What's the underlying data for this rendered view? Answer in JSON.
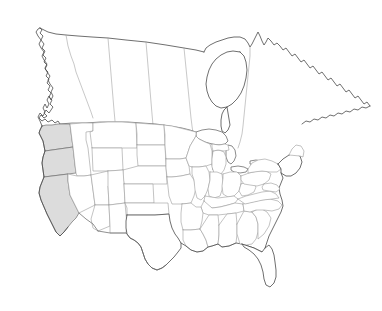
{
  "map": {
    "title": "North America outline map",
    "projection_note": "Continental United States and Canada, blank outline",
    "background_color": "#ffffff",
    "coastline_color": "#4a4a4a",
    "state_border_color": "#9a9a9a",
    "province_border_color": "#a3a3a3",
    "international_border_color": "#6b6b6b",
    "highlight_fill_color": "#dcdcdc",
    "highlight_stroke_color": "#707070",
    "unhighlighted_fill_color": "#ffffff",
    "labels": [],
    "legend": [],
    "highlighted_regions": [
      {
        "name": "Washington",
        "abbr": "WA",
        "fill": "#dcdcdc"
      },
      {
        "name": "Oregon",
        "abbr": "OR",
        "fill": "#dcdcdc"
      },
      {
        "name": "California",
        "abbr": "CA",
        "fill": "#dcdcdc"
      }
    ],
    "regions_shown": {
      "countries": [
        "United States",
        "Canada"
      ],
      "water_bodies": [
        "Hudson Bay",
        "Great Lakes",
        "Gulf of Mexico",
        "Pacific Ocean",
        "Atlantic Ocean"
      ]
    }
  }
}
